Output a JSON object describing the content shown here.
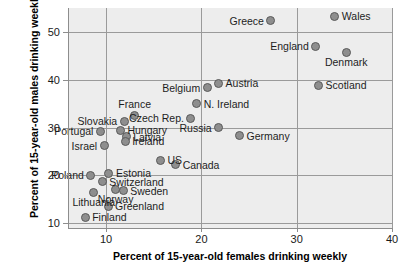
{
  "chart_data": {
    "type": "scatter",
    "title": "",
    "xlabel": "Percent of 15-year-old females drinking weekly",
    "ylabel": "Percent of 15-year-old males drinking weekly",
    "xlim": [
      6.0,
      40.0
    ],
    "ylim": [
      9.0,
      55.0
    ],
    "xticks": [
      10,
      20,
      30,
      40
    ],
    "yticks": [
      10,
      20,
      30,
      40,
      50
    ],
    "grid": true,
    "legend": "none",
    "plot_background": "#ededed",
    "marker_fill": "#8e8e8e",
    "marker_edge": "#5a5a5a",
    "points": [
      {
        "label": "Wales",
        "x": 34.0,
        "y": 53.3,
        "label_pos": "l"
      },
      {
        "label": "Greece",
        "x": 27.3,
        "y": 52.3,
        "label_pos": "r"
      },
      {
        "label": "England",
        "x": 32.0,
        "y": 47.0,
        "label_pos": "r"
      },
      {
        "label": "Denmark",
        "x": 35.2,
        "y": 45.7,
        "label_pos": "b"
      },
      {
        "label": "Scotland",
        "x": 32.3,
        "y": 38.9,
        "label_pos": "l"
      },
      {
        "label": "Austria",
        "x": 21.8,
        "y": 39.3,
        "label_pos": "l"
      },
      {
        "label": "Belgium",
        "x": 20.6,
        "y": 38.3,
        "label_pos": "r"
      },
      {
        "label": "N. Ireland",
        "x": 19.5,
        "y": 35.0,
        "label_pos": "l"
      },
      {
        "label": "Czech Rep.",
        "x": 18.9,
        "y": 32.0,
        "label_pos": "r"
      },
      {
        "label": "France",
        "x": 13.0,
        "y": 32.5,
        "label_pos": "t"
      },
      {
        "label": "Slovakia",
        "x": 11.9,
        "y": 31.3,
        "label_pos": "r"
      },
      {
        "label": "Portugal",
        "x": 9.4,
        "y": 29.2,
        "label_pos": "r"
      },
      {
        "label": "Hungary",
        "x": 11.5,
        "y": 29.4,
        "label_pos": "l"
      },
      {
        "label": "Latvia",
        "x": 12.1,
        "y": 28.1,
        "label_pos": "l"
      },
      {
        "label": "Ireland",
        "x": 12.0,
        "y": 27.1,
        "label_pos": "l"
      },
      {
        "label": "Russia",
        "x": 21.8,
        "y": 30.0,
        "label_pos": "r"
      },
      {
        "label": "Germany",
        "x": 24.0,
        "y": 28.3,
        "label_pos": "l"
      },
      {
        "label": "Israel",
        "x": 9.8,
        "y": 26.2,
        "label_pos": "r"
      },
      {
        "label": "US",
        "x": 15.7,
        "y": 23.2,
        "label_pos": "l"
      },
      {
        "label": "Canada",
        "x": 17.3,
        "y": 22.2,
        "label_pos": "l"
      },
      {
        "label": "Poland",
        "x": 8.4,
        "y": 20.0,
        "label_pos": "r"
      },
      {
        "label": "Estonia",
        "x": 10.3,
        "y": 20.4,
        "label_pos": "l"
      },
      {
        "label": "Switzerland",
        "x": 9.6,
        "y": 18.7,
        "label_pos": "l"
      },
      {
        "label": "Sweden",
        "x": 11.8,
        "y": 16.8,
        "label_pos": "l"
      },
      {
        "label": "Norway",
        "x": 11.0,
        "y": 17.1,
        "label_pos": "b"
      },
      {
        "label": "Lithuania",
        "x": 8.7,
        "y": 16.5,
        "label_pos": "b"
      },
      {
        "label": "Greenland",
        "x": 10.2,
        "y": 13.6,
        "label_pos": "l"
      },
      {
        "label": "Finland",
        "x": 7.8,
        "y": 11.3,
        "label_pos": "l"
      }
    ]
  }
}
